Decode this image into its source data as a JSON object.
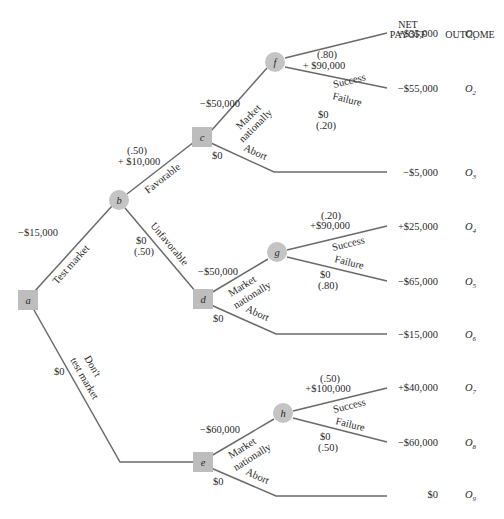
{
  "header": {
    "net_payoff_line1": "NET",
    "net_payoff_line2": "PAYOFF",
    "outcome": "OUTCOME"
  },
  "nodes": {
    "a": {
      "label": "a",
      "type": "decision"
    },
    "b": {
      "label": "b",
      "type": "chance"
    },
    "c": {
      "label": "c",
      "type": "decision"
    },
    "d": {
      "label": "d",
      "type": "decision"
    },
    "e": {
      "label": "e",
      "type": "decision"
    },
    "f": {
      "label": "f",
      "type": "chance"
    },
    "g": {
      "label": "g",
      "type": "chance"
    },
    "h": {
      "label": "h",
      "type": "chance"
    }
  },
  "branches": {
    "test_market": {
      "label": "Test market",
      "value": "−$15,000"
    },
    "dont_test": {
      "label1": "Don't",
      "label2": "test market",
      "value": "$0"
    },
    "favorable": {
      "label": "Favorable",
      "prob": "(.50)",
      "value": "+ $10,000"
    },
    "unfavorable": {
      "label": "Unfavorable",
      "prob": "(.50)",
      "value": "$0"
    },
    "c_market": {
      "label1": "Market",
      "label2": "nationally",
      "value": "−$50,000"
    },
    "c_abort": {
      "label": "Abort",
      "value": "$0"
    },
    "d_market": {
      "label1": "Market",
      "label2": "nationally",
      "value": "−$50,000"
    },
    "d_abort": {
      "label": "Abort",
      "value": "$0"
    },
    "e_market": {
      "label1": "Market",
      "label2": "nationally",
      "value": "−$60,000"
    },
    "e_abort": {
      "label": "Abort",
      "value": "$0"
    },
    "f_success": {
      "label": "Success",
      "prob": "(.80)",
      "value": "+ $90,000"
    },
    "f_failure": {
      "label": "Failure",
      "prob": "(.20)",
      "value": "$0"
    },
    "g_success": {
      "label": "Success",
      "prob": "(.20)",
      "value": "+$90,000"
    },
    "g_failure": {
      "label": "Failure",
      "prob": "(.80)",
      "value": "$0"
    },
    "h_success": {
      "label": "Success",
      "prob": "(.50)",
      "value": "+$100,000"
    },
    "h_failure": {
      "label": "Failure",
      "prob": "(.50)",
      "value": "$0"
    }
  },
  "outcomes": [
    {
      "payoff": "+$35,000",
      "id": "O",
      "sub": "1"
    },
    {
      "payoff": "−$55,000",
      "id": "O",
      "sub": "2"
    },
    {
      "payoff": "−$5,000",
      "id": "O",
      "sub": "3"
    },
    {
      "payoff": "+$25,000",
      "id": "O",
      "sub": "4"
    },
    {
      "payoff": "−$65,000",
      "id": "O",
      "sub": "5"
    },
    {
      "payoff": "−$15,000",
      "id": "O",
      "sub": "6"
    },
    {
      "payoff": "+$40,000",
      "id": "O",
      "sub": "7"
    },
    {
      "payoff": "−$60,000",
      "id": "O",
      "sub": "8"
    },
    {
      "payoff": "$0",
      "id": "O",
      "sub": "9"
    }
  ],
  "colors": {
    "edge": "#6a6a6a",
    "decision_node": "#bdbdbd",
    "chance_node": "#c4c4c4",
    "text": "#2a2a2a"
  }
}
